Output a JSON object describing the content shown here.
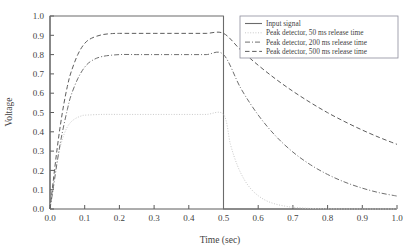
{
  "chart_data": {
    "type": "line",
    "title": "",
    "xlabel": "Time (sec)",
    "ylabel": "Voltage",
    "xlim": [
      0.0,
      1.0
    ],
    "ylim": [
      0.0,
      1.0
    ],
    "grid": false,
    "legend_position": "top-right",
    "xticks": [
      "0.0",
      "0.1",
      "0.2",
      "0.3",
      "0.4",
      "0.5",
      "0.6",
      "0.7",
      "0.8",
      "0.9",
      "1.0"
    ],
    "xtick_values": [
      0.0,
      0.1,
      0.2,
      0.3,
      0.4,
      0.5,
      0.6,
      0.7,
      0.8,
      0.9,
      1.0
    ],
    "yticks": [
      "0.0",
      "0.1",
      "0.2",
      "0.3",
      "0.4",
      "0.5",
      "0.6",
      "0.7",
      "0.8",
      "0.9",
      "1.0"
    ],
    "ytick_values": [
      0.0,
      0.1,
      0.2,
      0.3,
      0.4,
      0.5,
      0.6,
      0.7,
      0.8,
      0.9,
      1.0
    ],
    "series": [
      {
        "name": "Input signal",
        "style": "solid",
        "color": "#6b6b6b",
        "x": [
          0.0,
          0.0,
          0.5,
          0.5,
          1.0
        ],
        "values": [
          0.0,
          1.0,
          1.0,
          0.0,
          0.0
        ]
      },
      {
        "name": "Peak detector, 50 ms release time",
        "style": "dotted",
        "color": "#c9c9c9",
        "x": [
          0.0,
          0.01,
          0.02,
          0.03,
          0.04,
          0.05,
          0.06,
          0.07,
          0.08,
          0.09,
          0.1,
          0.15,
          0.2,
          0.25,
          0.3,
          0.35,
          0.4,
          0.45,
          0.5,
          0.52,
          0.54,
          0.56,
          0.58,
          0.6,
          0.62,
          0.64,
          0.66,
          0.68,
          0.7,
          0.75,
          0.8,
          0.85,
          0.9,
          0.95,
          1.0
        ],
        "values": [
          0.0,
          0.13,
          0.245,
          0.325,
          0.385,
          0.425,
          0.45,
          0.465,
          0.475,
          0.482,
          0.486,
          0.49,
          0.49,
          0.49,
          0.49,
          0.49,
          0.49,
          0.49,
          0.49,
          0.335,
          0.226,
          0.152,
          0.102,
          0.069,
          0.046,
          0.031,
          0.021,
          0.014,
          0.009,
          0.003,
          0.001,
          0.0,
          0.0,
          0.0,
          0.0
        ]
      },
      {
        "name": "Peak detector, 200 ms release time",
        "style": "dashdot",
        "color": "#6f6f6f",
        "x": [
          0.0,
          0.01,
          0.02,
          0.03,
          0.04,
          0.05,
          0.06,
          0.08,
          0.1,
          0.12,
          0.15,
          0.2,
          0.25,
          0.3,
          0.35,
          0.4,
          0.45,
          0.5,
          0.55,
          0.6,
          0.65,
          0.7,
          0.75,
          0.8,
          0.85,
          0.9,
          0.95,
          1.0
        ],
        "values": [
          0.0,
          0.115,
          0.235,
          0.345,
          0.435,
          0.515,
          0.585,
          0.675,
          0.735,
          0.768,
          0.79,
          0.8,
          0.8,
          0.8,
          0.8,
          0.8,
          0.8,
          0.8,
          0.625,
          0.487,
          0.379,
          0.295,
          0.23,
          0.179,
          0.139,
          0.108,
          0.084,
          0.067
        ]
      },
      {
        "name": "Peak detector, 500 ms release time",
        "style": "dashed",
        "color": "#5d5d5d",
        "x": [
          0.0,
          0.01,
          0.02,
          0.03,
          0.04,
          0.05,
          0.06,
          0.08,
          0.1,
          0.12,
          0.15,
          0.18,
          0.2,
          0.25,
          0.3,
          0.35,
          0.4,
          0.45,
          0.5,
          0.55,
          0.6,
          0.65,
          0.7,
          0.75,
          0.8,
          0.85,
          0.9,
          0.95,
          1.0
        ],
        "values": [
          0.0,
          0.155,
          0.305,
          0.435,
          0.545,
          0.635,
          0.705,
          0.8,
          0.858,
          0.885,
          0.903,
          0.909,
          0.91,
          0.91,
          0.91,
          0.91,
          0.91,
          0.91,
          0.91,
          0.823,
          0.745,
          0.674,
          0.61,
          0.552,
          0.499,
          0.452,
          0.409,
          0.37,
          0.335
        ]
      }
    ]
  },
  "legend": {
    "entries": [
      "Input signal",
      "Peak detector, 50 ms release time",
      "Peak detector, 200 ms release time",
      "Peak detector, 500 ms release time"
    ]
  }
}
